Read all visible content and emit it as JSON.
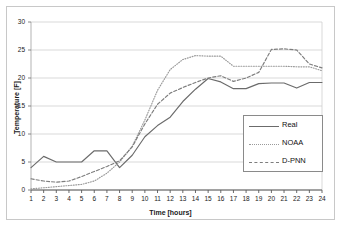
{
  "chart_data": {
    "type": "line",
    "title": "",
    "xlabel": "Time [hours]",
    "ylabel": "Temperature [F]",
    "xlim": [
      1,
      24
    ],
    "ylim": [
      0,
      30
    ],
    "yticks": [
      0,
      5,
      10,
      15,
      20,
      25,
      30
    ],
    "xticks": [
      1,
      2,
      3,
      4,
      5,
      6,
      7,
      8,
      9,
      10,
      11,
      12,
      13,
      14,
      15,
      16,
      17,
      18,
      19,
      20,
      21,
      22,
      23,
      24
    ],
    "grid": "horizontal",
    "legend_position": "lower-right-inside",
    "x": [
      1,
      2,
      3,
      4,
      5,
      6,
      7,
      8,
      9,
      10,
      11,
      12,
      13,
      14,
      15,
      16,
      17,
      18,
      19,
      20,
      21,
      22,
      23,
      24
    ],
    "series": [
      {
        "name": "Real",
        "style": "solid",
        "color": "#6b6b6b",
        "values": [
          4.0,
          6.0,
          5.0,
          5.0,
          5.0,
          7.0,
          7.0,
          4.0,
          6.2,
          9.5,
          11.5,
          13.0,
          15.8,
          18.0,
          19.9,
          19.3,
          18.1,
          18.1,
          19.0,
          19.1,
          19.1,
          18.2,
          19.2,
          19.2
        ]
      },
      {
        "name": "NOAA",
        "style": "dotted",
        "color": "#9a9a9a",
        "values": [
          0.2,
          0.4,
          0.6,
          0.8,
          1.0,
          1.6,
          3.0,
          5.0,
          7.8,
          12.5,
          17.8,
          21.5,
          23.3,
          24.0,
          23.9,
          23.9,
          22.1,
          22.1,
          22.1,
          22.1,
          22.1,
          22.0,
          22.0,
          21.3
        ]
      },
      {
        "name": "D-PNN",
        "style": "dashed",
        "color": "#7d7d7d",
        "values": [
          2.0,
          1.6,
          1.4,
          1.6,
          2.4,
          3.3,
          4.2,
          5.2,
          7.7,
          11.8,
          15.3,
          17.3,
          18.3,
          19.2,
          20.0,
          20.4,
          19.4,
          20.0,
          21.0,
          25.1,
          25.2,
          25.0,
          22.5,
          21.8
        ]
      }
    ]
  },
  "legend": {
    "items": [
      {
        "label": "Real"
      },
      {
        "label": "NOAA"
      },
      {
        "label": "D-PNN"
      }
    ]
  }
}
